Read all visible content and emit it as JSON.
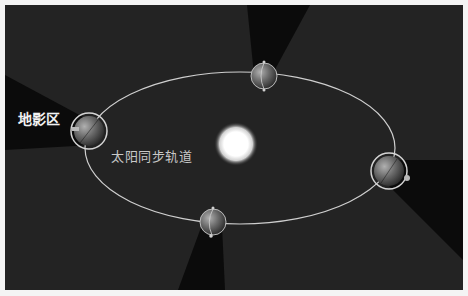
{
  "diagram": {
    "labels": {
      "shadow_zone": "地影区",
      "orbit": "太阳同步轨道"
    },
    "colors": {
      "background": "#232323",
      "border": "#f4f4f4",
      "orbit_line": "#cfcfcf",
      "shadow": "#0b0b0b",
      "sun_core": "#ffffff",
      "label_text": "#e8e8e8"
    },
    "sun": {
      "cx": 236,
      "cy": 144,
      "r": 16
    },
    "orbit": {
      "cx": 240,
      "cy": 148,
      "rx": 155,
      "ry": 76
    },
    "earths": [
      {
        "name": "earth-top",
        "cx": 264,
        "cy": 76,
        "r": 13,
        "ring": false
      },
      {
        "name": "earth-left",
        "cx": 89,
        "cy": 131,
        "r": 16,
        "ring": true
      },
      {
        "name": "earth-right",
        "cx": 389,
        "cy": 171,
        "r": 16,
        "ring": true
      },
      {
        "name": "earth-bottom",
        "cx": 213,
        "cy": 222,
        "r": 13,
        "ring": false
      }
    ]
  }
}
